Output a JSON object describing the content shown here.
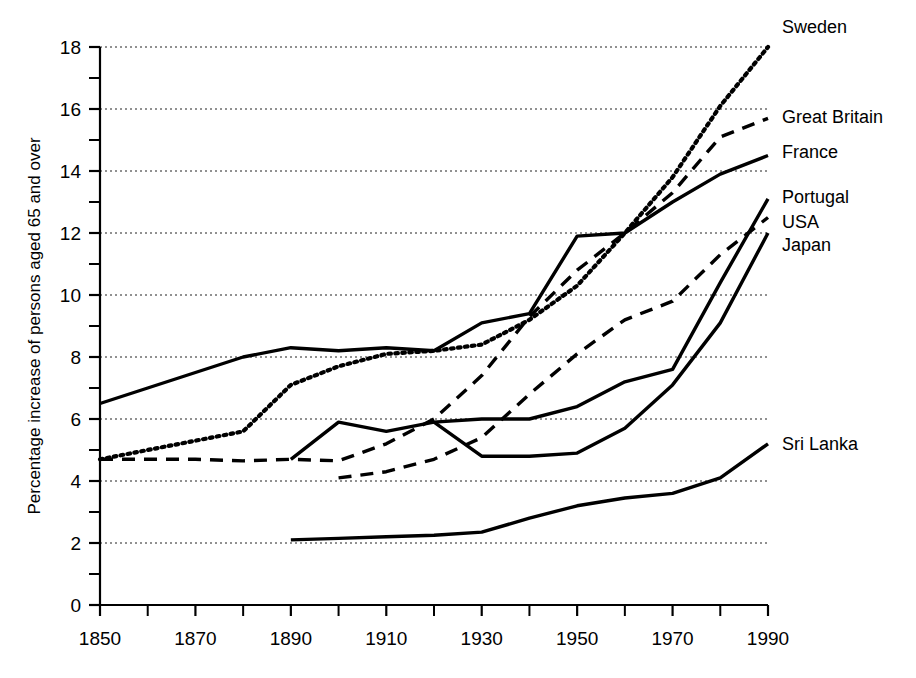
{
  "chart_data": {
    "type": "line",
    "title": "",
    "xlabel": "",
    "ylabel": "Percentage increase of persons aged 65 and over",
    "xlim": [
      1850,
      1990
    ],
    "ylim": [
      0,
      18
    ],
    "grid": true,
    "legend_position": "right-inline-labels",
    "x_ticks_major": [
      1850,
      1870,
      1890,
      1910,
      1930,
      1950,
      1970,
      1990
    ],
    "x_ticks_minor": [
      1860,
      1880,
      1900,
      1920,
      1940,
      1960,
      1980
    ],
    "y_ticks_major": [
      0,
      2,
      4,
      6,
      8,
      10,
      12,
      14,
      16,
      18
    ],
    "y_ticks_minor": [
      1,
      3,
      5,
      7,
      9,
      11,
      13,
      15,
      17
    ],
    "x_tick_labels": [
      "1850",
      "1870",
      "1890",
      "1910",
      "1930",
      "1950",
      "1970",
      "1990"
    ],
    "y_tick_labels": [
      "0",
      "2",
      "4",
      "6",
      "8",
      "10",
      "12",
      "14",
      "16",
      "18"
    ],
    "series": [
      {
        "name": "Sweden",
        "label": "Sweden",
        "line_style": "dotted",
        "color": "#000000",
        "x": [
          1850,
          1860,
          1870,
          1880,
          1890,
          1900,
          1910,
          1920,
          1930,
          1940,
          1950,
          1960,
          1970,
          1980,
          1990
        ],
        "values": [
          4.7,
          5.0,
          5.3,
          5.6,
          7.1,
          7.7,
          8.1,
          8.2,
          8.4,
          9.2,
          10.3,
          12.0,
          13.8,
          16.1,
          18.0
        ]
      },
      {
        "name": "Great Britain",
        "label": "Great Britain",
        "line_style": "dashed",
        "color": "#000000",
        "x": [
          1850,
          1860,
          1870,
          1880,
          1890,
          1900,
          1910,
          1920,
          1930,
          1940,
          1950,
          1960,
          1970,
          1980,
          1990
        ],
        "values": [
          4.7,
          4.7,
          4.7,
          4.65,
          4.7,
          4.65,
          5.2,
          6.0,
          7.4,
          9.3,
          10.8,
          12.0,
          13.3,
          15.1,
          15.7
        ]
      },
      {
        "name": "France",
        "label": "France",
        "line_style": "solid",
        "color": "#000000",
        "x": [
          1850,
          1860,
          1870,
          1880,
          1890,
          1900,
          1910,
          1920,
          1930,
          1940,
          1950,
          1960,
          1970,
          1980,
          1990
        ],
        "values": [
          6.5,
          7.0,
          7.5,
          8.0,
          8.3,
          8.2,
          8.3,
          8.2,
          9.1,
          9.4,
          11.9,
          12.0,
          13.0,
          13.9,
          14.5
        ]
      },
      {
        "name": "Portugal",
        "label": "Portugal",
        "line_style": "solid",
        "color": "#000000",
        "x": [
          1890,
          1900,
          1910,
          1920,
          1930,
          1940,
          1950,
          1960,
          1970,
          1980,
          1990
        ],
        "values": [
          4.7,
          5.9,
          5.6,
          5.9,
          6.0,
          6.0,
          6.4,
          7.2,
          7.6,
          10.4,
          13.1
        ]
      },
      {
        "name": "USA",
        "label": "USA",
        "line_style": "dashed",
        "color": "#000000",
        "x": [
          1900,
          1910,
          1920,
          1930,
          1940,
          1950,
          1960,
          1970,
          1980,
          1990
        ],
        "values": [
          4.1,
          4.3,
          4.7,
          5.4,
          6.8,
          8.1,
          9.2,
          9.8,
          11.3,
          12.5
        ]
      },
      {
        "name": "Japan",
        "label": "Japan",
        "line_style": "solid",
        "color": "#000000",
        "x": [
          1920,
          1930,
          1940,
          1950,
          1960,
          1970,
          1980,
          1990
        ],
        "values": [
          5.9,
          4.8,
          4.8,
          4.9,
          5.7,
          7.1,
          9.1,
          12.0
        ]
      },
      {
        "name": "Sri Lanka",
        "label": "Sri Lanka",
        "line_style": "solid",
        "color": "#000000",
        "x": [
          1890,
          1900,
          1910,
          1920,
          1930,
          1940,
          1950,
          1960,
          1970,
          1980,
          1990
        ],
        "values": [
          2.1,
          2.15,
          2.2,
          2.25,
          2.35,
          2.8,
          3.2,
          3.45,
          3.6,
          4.1,
          5.2
        ]
      }
    ]
  },
  "axis": {
    "y_title": "Percentage increase of persons aged 65 and over"
  },
  "labels": {
    "sweden": "Sweden",
    "great_britain": "Great Britain",
    "france": "France",
    "portugal": "Portugal",
    "usa": "USA",
    "japan": "Japan",
    "sri_lanka": "Sri Lanka"
  }
}
